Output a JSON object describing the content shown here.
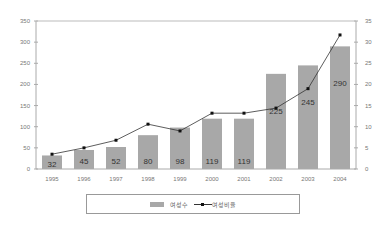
{
  "chart_data": {
    "type": "bar",
    "title": "",
    "categories": [
      "1995",
      "1996",
      "1997",
      "1998",
      "1999",
      "2000",
      "2001",
      "2002",
      "2003",
      "2004"
    ],
    "series": [
      {
        "name": "여성수",
        "type": "bar",
        "axis": "left",
        "color": "#a8a8a8",
        "values": [
          32,
          45,
          52,
          80,
          98,
          119,
          119,
          225,
          245,
          290
        ]
      },
      {
        "name": "여성비율",
        "type": "line",
        "axis": "right",
        "color": "#333333",
        "values": [
          3.5,
          5.0,
          6.8,
          10.6,
          9.0,
          13.2,
          13.2,
          14.4,
          19.0,
          31.7
        ]
      }
    ],
    "left_axis": {
      "ylim": [
        0,
        350
      ],
      "ticks": [
        0,
        50,
        100,
        150,
        200,
        250,
        300,
        350
      ]
    },
    "right_axis": {
      "ylim": [
        0,
        35
      ],
      "ticks": [
        0,
        5,
        10,
        15,
        20,
        25,
        30,
        35
      ]
    },
    "xlabel": "",
    "ylabel": "",
    "grid": false,
    "legend_position": "bottom"
  },
  "legend": {
    "bar_label": "여성수",
    "line_label": "여성비율"
  }
}
